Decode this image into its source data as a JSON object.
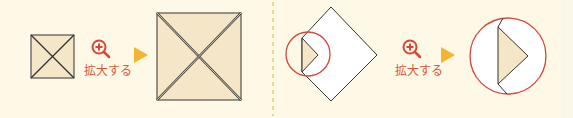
{
  "colors": {
    "background": "#fdf9e6",
    "paper_fill": "#f5e6c8",
    "line": "#333333",
    "accent_red": "#d9453a",
    "arrow_orange": "#f5b430",
    "divider": "#f0c872",
    "white_paper": "#ffffff"
  },
  "left_step": {
    "zoom_label": "拡大する",
    "zoom_icon": "zoom-in-icon",
    "arrow_icon": "play-arrow-icon"
  },
  "right_step": {
    "zoom_label": "拡大する",
    "zoom_icon": "zoom-in-icon",
    "arrow_icon": "play-arrow-icon"
  }
}
